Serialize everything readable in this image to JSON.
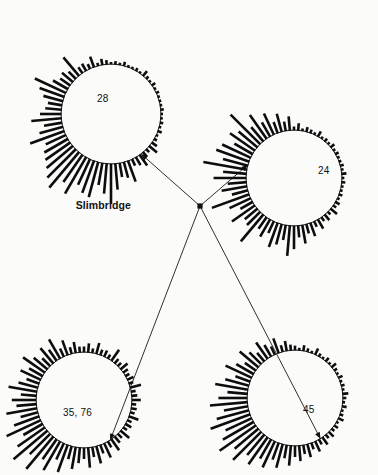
{
  "figure": {
    "background_color": "#fbfbfa",
    "ink_color": "#101010",
    "width": 378,
    "height": 475,
    "hub": {
      "label": "Slimbridge",
      "x": 200,
      "y": 206,
      "label_x": 131,
      "label_y": 209
    }
  },
  "chart_data": {
    "type": "bar",
    "subtype": "circular-histogram-network",
    "title": "",
    "xlabel": "",
    "ylabel": "",
    "grid": false,
    "legend_position": "none",
    "hub_label": "Slimbridge",
    "angle_range_deg": [
      0,
      360
    ],
    "bar_count_per_circle": 72,
    "roses": [
      {
        "name": "rose-top-left",
        "label": "28",
        "cx": 111,
        "cy": 114,
        "r": 50,
        "label_x": 97,
        "label_y": 102,
        "arrow_angle_deg": 53,
        "leader_from": "hub",
        "bar_width": 2.6,
        "max_bar_len": 46,
        "values": [
          2,
          3,
          2,
          4,
          2,
          2,
          3,
          2,
          6,
          3,
          2,
          4,
          2,
          3,
          2,
          2,
          2,
          3,
          2,
          2,
          3,
          2,
          4,
          2,
          3,
          6,
          10,
          4,
          6,
          13,
          9,
          7,
          22,
          16,
          14,
          26,
          40,
          30,
          22,
          36,
          34,
          28,
          42,
          33,
          46,
          40,
          34,
          30,
          27,
          22,
          36,
          24,
          18,
          30,
          21,
          16,
          14,
          20,
          26,
          34,
          17,
          12,
          14,
          10,
          24,
          7,
          8,
          5,
          11,
          3,
          6,
          4
        ]
      },
      {
        "name": "rose-top-right",
        "label": "24",
        "cx": 294,
        "cy": 178,
        "r": 48,
        "label_x": 318,
        "label_y": 174,
        "arrow_angle_deg": 196,
        "leader_from": "hub",
        "bar_width": 2.6,
        "max_bar_len": 44,
        "values": [
          3,
          6,
          2,
          4,
          3,
          2,
          5,
          2,
          3,
          2,
          4,
          2,
          3,
          2,
          2,
          3,
          2,
          4,
          2,
          3,
          2,
          2,
          3,
          2,
          4,
          3,
          7,
          3,
          6,
          4,
          9,
          5,
          12,
          8,
          16,
          10,
          20,
          26,
          13,
          18,
          22,
          11,
          17,
          12,
          30,
          16,
          14,
          24,
          12,
          20,
          34,
          14,
          22,
          16,
          28,
          20,
          38,
          22,
          30,
          27,
          18,
          26,
          21,
          36,
          16,
          25,
          14,
          20,
          10,
          16,
          8,
          12
        ]
      },
      {
        "name": "rose-bottom-left",
        "label": "35, 76",
        "cx": 84,
        "cy": 400,
        "r": 48,
        "label_x": 63,
        "label_y": 416,
        "arrow_angle_deg": 57,
        "leader_from": "hub",
        "bar_width": 2.6,
        "max_bar_len": 44,
        "values": [
          5,
          8,
          4,
          10,
          5,
          6,
          4,
          12,
          5,
          4,
          8,
          5,
          4,
          6,
          4,
          10,
          4,
          5,
          8,
          4,
          5,
          4,
          9,
          4,
          6,
          4,
          10,
          5,
          7,
          12,
          6,
          14,
          8,
          16,
          9,
          18,
          10,
          14,
          20,
          12,
          26,
          16,
          30,
          22,
          38,
          26,
          40,
          30,
          20,
          34,
          24,
          16,
          28,
          18,
          22,
          14,
          26,
          18,
          12,
          20,
          14,
          24,
          16,
          10,
          18,
          12,
          20,
          8,
          14,
          6,
          10,
          5
        ]
      },
      {
        "name": "rose-bottom-right",
        "label": "45",
        "cx": 295,
        "cy": 398,
        "r": 48,
        "label_x": 303,
        "label_y": 413,
        "arrow_angle_deg": 58,
        "leader_from": "hub",
        "bar_width": 2.6,
        "max_bar_len": 44,
        "values": [
          4,
          2,
          5,
          3,
          2,
          6,
          3,
          2,
          4,
          2,
          5,
          3,
          2,
          4,
          2,
          3,
          2,
          5,
          3,
          2,
          4,
          2,
          3,
          5,
          2,
          4,
          3,
          6,
          4,
          8,
          5,
          10,
          6,
          12,
          8,
          14,
          10,
          18,
          12,
          22,
          16,
          26,
          20,
          30,
          24,
          36,
          28,
          40,
          32,
          26,
          38,
          30,
          22,
          34,
          26,
          18,
          30,
          22,
          14,
          26,
          18,
          12,
          22,
          15,
          10,
          18,
          12,
          8,
          14,
          6,
          9,
          5
        ]
      }
    ]
  }
}
